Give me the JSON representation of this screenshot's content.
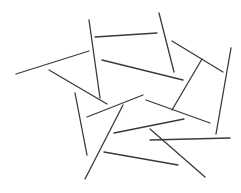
{
  "canvas": {
    "width": 241,
    "height": 193,
    "background": "#ffffff",
    "stroke_color": "#3a3a3a"
  },
  "segments": [
    {
      "x1": 16,
      "y1": 74,
      "x2": 89,
      "y2": 51
    },
    {
      "x1": 89,
      "y1": 20,
      "x2": 100,
      "y2": 98
    },
    {
      "x1": 95,
      "y1": 37,
      "x2": 157,
      "y2": 33
    },
    {
      "x1": 159,
      "y1": 13,
      "x2": 174,
      "y2": 72
    },
    {
      "x1": 102,
      "y1": 60,
      "x2": 183,
      "y2": 80
    },
    {
      "x1": 49,
      "y1": 70,
      "x2": 107,
      "y2": 104
    },
    {
      "x1": 172,
      "y1": 41,
      "x2": 223,
      "y2": 72
    },
    {
      "x1": 202,
      "y1": 59,
      "x2": 172,
      "y2": 110
    },
    {
      "x1": 231,
      "y1": 48,
      "x2": 216,
      "y2": 134
    },
    {
      "x1": 146,
      "y1": 100,
      "x2": 210,
      "y2": 123
    },
    {
      "x1": 87,
      "y1": 117,
      "x2": 143,
      "y2": 95
    },
    {
      "x1": 75,
      "y1": 93,
      "x2": 87,
      "y2": 155
    },
    {
      "x1": 123,
      "y1": 105,
      "x2": 85,
      "y2": 179
    },
    {
      "x1": 114,
      "y1": 133,
      "x2": 184,
      "y2": 119
    },
    {
      "x1": 150,
      "y1": 140,
      "x2": 230,
      "y2": 138
    },
    {
      "x1": 150,
      "y1": 129,
      "x2": 205,
      "y2": 177
    },
    {
      "x1": 104,
      "y1": 152,
      "x2": 178,
      "y2": 165
    }
  ]
}
